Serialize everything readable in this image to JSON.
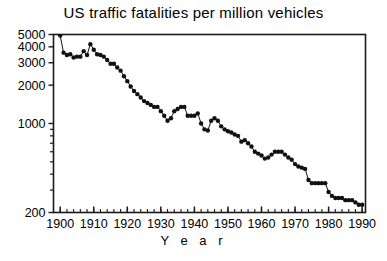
{
  "chart_data": {
    "type": "line",
    "title": "US traffic fatalities per million vehicles",
    "xlabel": "Y e a r",
    "ylabel": "",
    "yscale": "log",
    "ylim": [
      200,
      5000
    ],
    "xlim": [
      1898,
      1991
    ],
    "grid": false,
    "legend": null,
    "marker": "filled-circle",
    "ytick_labels": [
      "5000",
      "4000",
      "3000",
      "2000",
      "1000",
      "200"
    ],
    "ytick_values": [
      5000,
      4000,
      3000,
      2000,
      1000,
      200
    ],
    "yminor_ticks": [
      900,
      800,
      700,
      600,
      500,
      400,
      300
    ],
    "xtick_labels": [
      "1900",
      "1910",
      "1920",
      "1930",
      "1940",
      "1950",
      "1960",
      "1970",
      "1980",
      "1990"
    ],
    "xtick_values": [
      1900,
      1910,
      1920,
      1930,
      1940,
      1950,
      1960,
      1970,
      1980,
      1990
    ],
    "xminor_step": 2,
    "x": [
      1900,
      1901,
      1902,
      1903,
      1904,
      1905,
      1906,
      1907,
      1908,
      1909,
      1910,
      1911,
      1912,
      1913,
      1914,
      1915,
      1916,
      1917,
      1918,
      1919,
      1920,
      1921,
      1922,
      1923,
      1924,
      1925,
      1926,
      1927,
      1928,
      1929,
      1930,
      1931,
      1932,
      1933,
      1934,
      1935,
      1936,
      1937,
      1938,
      1939,
      1940,
      1941,
      1942,
      1943,
      1944,
      1945,
      1946,
      1947,
      1948,
      1949,
      1950,
      1951,
      1952,
      1953,
      1954,
      1955,
      1956,
      1957,
      1958,
      1959,
      1960,
      1961,
      1962,
      1963,
      1964,
      1965,
      1966,
      1967,
      1968,
      1969,
      1970,
      1971,
      1972,
      1973,
      1974,
      1975,
      1976,
      1977,
      1978,
      1979,
      1980,
      1981,
      1982,
      1983,
      1984,
      1985,
      1986,
      1987,
      1988,
      1989,
      1990
    ],
    "values": [
      4900,
      3600,
      3450,
      3500,
      3300,
      3350,
      3350,
      3700,
      3450,
      4200,
      3800,
      3500,
      3450,
      3350,
      3150,
      2950,
      2950,
      2750,
      2600,
      2350,
      2150,
      1950,
      1800,
      1700,
      1600,
      1500,
      1450,
      1400,
      1350,
      1350,
      1250,
      1150,
      1050,
      1100,
      1250,
      1300,
      1350,
      1350,
      1150,
      1150,
      1150,
      1200,
      1000,
      900,
      880,
      1050,
      1100,
      1050,
      950,
      900,
      870,
      850,
      820,
      800,
      720,
      740,
      700,
      660,
      600,
      580,
      560,
      530,
      540,
      570,
      600,
      600,
      600,
      570,
      540,
      520,
      480,
      460,
      450,
      440,
      360,
      340,
      340,
      340,
      340,
      340,
      290,
      270,
      260,
      260,
      260,
      250,
      250,
      250,
      240,
      230,
      230
    ]
  }
}
